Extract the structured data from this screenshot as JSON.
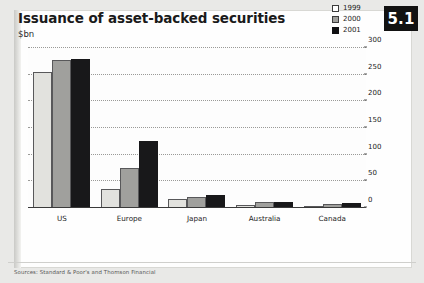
{
  "figure": {
    "number": "5.1",
    "title": "Issuance of asset-backed securities",
    "subtitle": "$bn",
    "sources": "Sources: Standard & Poor's and Thomson Financial"
  },
  "chart_data": {
    "type": "bar",
    "title": "Issuance of asset-backed securities",
    "subtitle": "$bn",
    "xlabel": "",
    "ylabel": "$bn",
    "ylim": [
      0,
      300
    ],
    "yticks": [
      0,
      50,
      100,
      150,
      200,
      250,
      300
    ],
    "ytick_labels": [
      "0",
      "50",
      "100",
      "150",
      "200",
      "250",
      "300"
    ],
    "grid": true,
    "legend_position": "top-right",
    "categories": [
      "US",
      "Europe",
      "Japan",
      "Australia",
      "Canada"
    ],
    "series": [
      {
        "name": "1999",
        "color": "#e2e2de",
        "values": [
          255,
          35,
          16,
          6,
          4
        ]
      },
      {
        "name": "2000",
        "color": "#a0a09d",
        "values": [
          278,
          75,
          20,
          11,
          8
        ]
      },
      {
        "name": "2001",
        "color": "#18181a",
        "values": [
          280,
          125,
          24,
          12,
          10
        ]
      }
    ]
  }
}
